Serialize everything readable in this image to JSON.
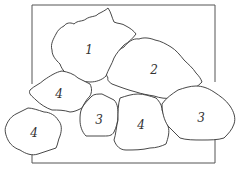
{
  "diagram": {
    "type": "planting-plan-sketch",
    "frame_color": "#555555",
    "line_color": "#333333",
    "background": "#ffffff",
    "shrubs": [
      {
        "id": "shrub-1",
        "label": "1",
        "cx": 89,
        "cy": 50
      },
      {
        "id": "shrub-2",
        "label": "2",
        "cx": 154,
        "cy": 70
      },
      {
        "id": "shrub-4a",
        "label": "4",
        "cx": 59,
        "cy": 94
      },
      {
        "id": "shrub-3a",
        "label": "3",
        "cx": 99,
        "cy": 120
      },
      {
        "id": "shrub-4b",
        "label": "4",
        "cx": 34,
        "cy": 133
      },
      {
        "id": "shrub-4c",
        "label": "4",
        "cx": 141,
        "cy": 125
      },
      {
        "id": "shrub-3b",
        "label": "3",
        "cx": 201,
        "cy": 118
      }
    ]
  }
}
